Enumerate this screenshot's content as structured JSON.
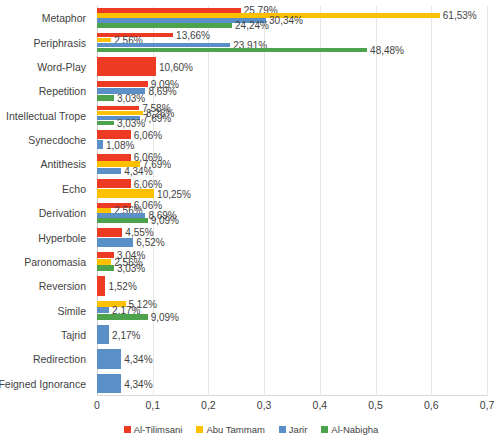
{
  "chart_data": {
    "type": "bar",
    "orientation": "horizontal",
    "title": "",
    "subtitle": "",
    "xlabel": "",
    "ylabel": "",
    "xlim": [
      0,
      0.7
    ],
    "grid": true,
    "legend_position": "bottom",
    "xticks": [
      "0",
      "0,1",
      "0,2",
      "0,3",
      "0,4",
      "0,5",
      "0,6",
      "0,7"
    ],
    "xtick_values": [
      0,
      0.1,
      0.2,
      0.3,
      0.4,
      0.5,
      0.6,
      0.7
    ],
    "categories": [
      "Metaphor",
      "Periphrasis",
      "Word-Play",
      "Repetition",
      "Intellectual Trope",
      "Synecdoche",
      "Antithesis",
      "Echo",
      "Derivation",
      "Hyperbole",
      "Paronomasia",
      "Reversion",
      "Simile",
      "Tajrid",
      "Redirection",
      "Feigned Ignorance"
    ],
    "series": [
      {
        "name": "Al-Tilimsani",
        "color": "#ED3B23",
        "values": [
          0.2579,
          0.1366,
          0.106,
          0.0909,
          0.0758,
          0.0606,
          0.0606,
          0.0606,
          0.0606,
          0.0455,
          0.0304,
          0.0152,
          null,
          null,
          null,
          null
        ],
        "labels": [
          "25,79%",
          "13,66%",
          "10,60%",
          "9,09%",
          "7,58%",
          "6,06%",
          "6,06%",
          "6,06%",
          "6,06%",
          "4,55%",
          "3,04%",
          "1,52%",
          "",
          "",
          "",
          ""
        ]
      },
      {
        "name": "Abu Tammam",
        "color": "#FFC000",
        "values": [
          0.6153,
          0.0256,
          null,
          null,
          0.0826,
          null,
          0.0769,
          0.1025,
          0.0256,
          null,
          0.0256,
          null,
          0.0512,
          null,
          null,
          null
        ],
        "labels": [
          "61,53%",
          "2,56%",
          "",
          "",
          "8,26%",
          "",
          "7,69%",
          "10,25%",
          "2,56%",
          "",
          "2,56%",
          "",
          "5,12%",
          "",
          "",
          ""
        ]
      },
      {
        "name": "Jarir",
        "color": "#5B8FC7",
        "values": [
          0.3034,
          0.2391,
          null,
          0.0869,
          0.0769,
          0.0108,
          0.0434,
          null,
          0.0869,
          0.0652,
          null,
          null,
          0.0217,
          0.0217,
          0.0434,
          0.0434
        ],
        "labels": [
          "30,34%",
          "23,91%",
          "",
          "8,69%",
          "7,69%",
          "1,08%",
          "4,34%",
          "",
          "8,69%",
          "6,52%",
          "",
          "",
          "2,17%",
          "2,17%",
          "4,34%",
          "4,34%"
        ]
      },
      {
        "name": "Al-Nabigha",
        "color": "#4CA34C",
        "values": [
          0.2424,
          0.4848,
          null,
          0.0303,
          0.0303,
          null,
          null,
          null,
          0.0909,
          null,
          0.0303,
          null,
          0.0909,
          null,
          null,
          null
        ],
        "labels": [
          "24,24%",
          "48,48%",
          "",
          "3,03%",
          "3,03%",
          "",
          "",
          "",
          "9,09%",
          "",
          "3,03%",
          "",
          "9,09%",
          "",
          "",
          ""
        ]
      }
    ]
  },
  "legend": {
    "items": [
      {
        "label": "Al-Tilimsani",
        "color": "#ED3B23"
      },
      {
        "label": "Abu Tammam",
        "color": "#FFC000"
      },
      {
        "label": "Jarir",
        "color": "#5B8FC7"
      },
      {
        "label": "Al-Nabigha",
        "color": "#4CA34C"
      }
    ]
  }
}
